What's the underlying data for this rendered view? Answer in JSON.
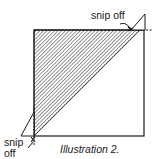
{
  "figure": {
    "caption": "Illustration 2.",
    "labels": {
      "top_right": "snip off",
      "bottom_left_line1": "snip",
      "bottom_left_line2": "off"
    },
    "colors": {
      "line": "#1a1a1a",
      "hatch": "#2a2a2a",
      "background": "#ffffff"
    },
    "shapes": {
      "square": "outline square",
      "hatched_region": "upper-left triangle above the diagonal",
      "flaps": [
        "top-right triangular flap",
        "bottom-left triangular flap"
      ]
    }
  }
}
